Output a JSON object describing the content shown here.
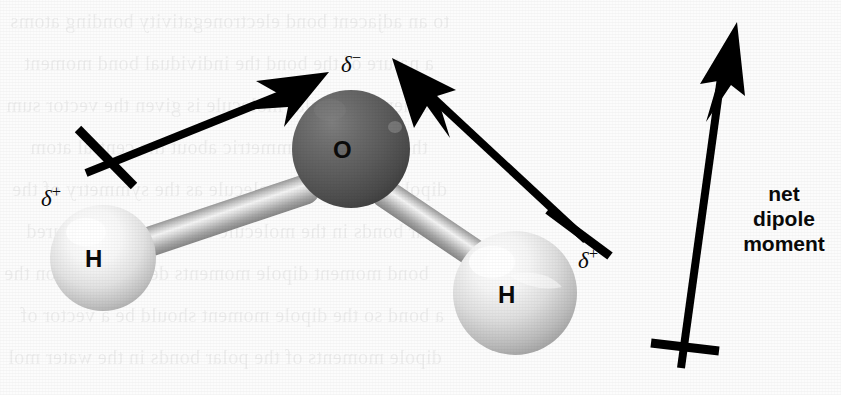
{
  "figure": {
    "background_color": "#fcfcfc",
    "ink_color": "#000000"
  },
  "atoms": [
    {
      "id": "oxygen",
      "label": "O",
      "charge_label": "δ",
      "charge_sign": "−",
      "color": "#5a5a5a",
      "cx": 351,
      "cy": 149,
      "r": 59
    },
    {
      "id": "hydrogen-left",
      "label": "H",
      "charge_label": "δ",
      "charge_sign": "+",
      "color": "#e9e9e9",
      "cx": 103,
      "cy": 258,
      "r": 53
    },
    {
      "id": "hydrogen-right",
      "label": "H",
      "charge_label": "δ",
      "charge_sign": "+",
      "color": "#e2e2e2",
      "cx": 515,
      "cy": 293,
      "r": 62
    }
  ],
  "labels": {
    "oxygen_atom": "O",
    "hydrogen_left_atom": "H",
    "hydrogen_right_atom": "H",
    "delta_symbol": "δ",
    "delta_negative_sign": "−",
    "delta_positive_sign": "+",
    "net_dipole_line1": "net",
    "net_dipole_line2": "dipole",
    "net_dipole_line3": "moment"
  },
  "arrows": [
    {
      "id": "bond-dipole-left",
      "from": [
        83,
        172
      ],
      "to": [
        327,
        74
      ],
      "crossbar_center": [
        105,
        158
      ],
      "direction": "H-to-O"
    },
    {
      "id": "bond-dipole-right",
      "from": [
        588,
        243
      ],
      "to": [
        394,
        60
      ],
      "crossbar_center": [
        578,
        231
      ],
      "direction": "H-to-O"
    },
    {
      "id": "net-dipole",
      "from": [
        681,
        368
      ],
      "to": [
        736,
        23
      ],
      "crossbar_center": [
        684,
        345
      ],
      "direction": "upward"
    }
  ],
  "bonds": [
    {
      "id": "bond-O-Hleft",
      "from": [
        146,
        243
      ],
      "to": [
        318,
        185
      ]
    },
    {
      "id": "bond-O-Hright",
      "from": [
        381,
        190
      ],
      "to": [
        489,
        263
      ]
    }
  ],
  "background_showthrough": {
    "description": "faint mirrored text bleeding through from the reverse page",
    "lines": [
      "to an adjacent bond electronegativity bonding atoms",
      "a nature of the bond the individual bond moment",
      "moment on a polar molecule is given the vector sum",
      "the bonds are symmetric about the central atom",
      "dipole moment the molecule as the symmetry of the",
      "polar bonds in the molecule a moment is measured",
      "bond moment dipole moments depending upon the",
      "a bond so the dipole moment should be a vector of",
      "dipole moments of the polar bonds in the water mol"
    ]
  }
}
